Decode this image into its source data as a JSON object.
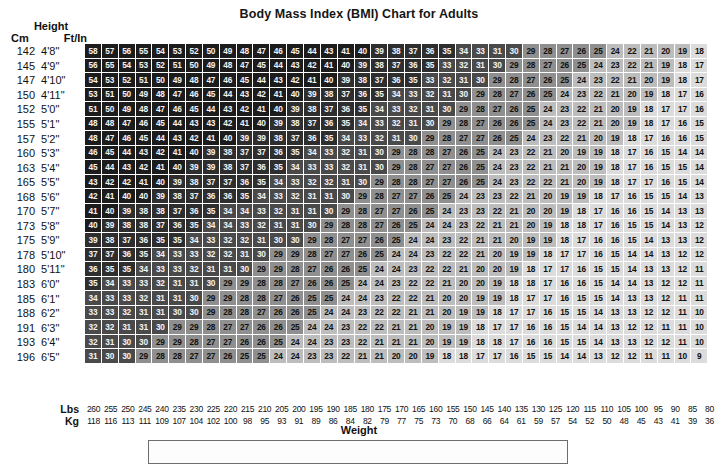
{
  "title": "Body Mass Index (BMI) Chart for Adults",
  "height_header": {
    "group": "Height",
    "cm": "Cm",
    "ftin": "Ft/In"
  },
  "weight_header": {
    "lbs": "Lbs",
    "kg": "Kg",
    "axis_title": "Weight"
  },
  "colors": {
    "band_obese_iii": "#1c1c1c",
    "band_obese_ii": "#2e2e2e",
    "band_obese_i": "#4a4a4a",
    "band_overweight": "#8f8f8f",
    "band_normal": "#bdbdbd",
    "band_under": "#dcdcdc",
    "grid_line": "#ffffff",
    "text_dark": "#111111",
    "text_light": "#f2f2f2",
    "page_background": "#ffffff"
  },
  "chart_data": {
    "type": "heatmap",
    "title": "Body Mass Index (BMI) Chart for Adults",
    "xlabel": "Weight",
    "ylabel": "Height",
    "grid": true,
    "legend": "none",
    "x_axis": {
      "label": "Weight",
      "units": [
        "Lbs",
        "Kg"
      ],
      "lbs": [
        260,
        255,
        250,
        245,
        240,
        235,
        230,
        225,
        220,
        215,
        210,
        205,
        200,
        195,
        190,
        185,
        180,
        175,
        170,
        165,
        160,
        155,
        150,
        145,
        140,
        135,
        130,
        125,
        120,
        115,
        110,
        105,
        100,
        95,
        90,
        85,
        80
      ],
      "kg": [
        118,
        116,
        113,
        111,
        109,
        107,
        104,
        102,
        100,
        98,
        95,
        93,
        91,
        89,
        86,
        84,
        82,
        79,
        77,
        75,
        73,
        70,
        68,
        66,
        64,
        61,
        59,
        57,
        54,
        52,
        50,
        48,
        45,
        43,
        41,
        39,
        36
      ]
    },
    "y_axis": {
      "label": "Height",
      "units": [
        "Cm",
        "Ft/In"
      ],
      "cm": [
        142,
        145,
        147,
        150,
        152,
        155,
        157,
        160,
        163,
        165,
        168,
        170,
        173,
        175,
        178,
        180,
        183,
        185,
        188,
        191,
        193,
        196
      ],
      "ftin": [
        "4'8\"",
        "4'9\"",
        "4'10\"",
        "4'11\"",
        "5'0\"",
        "5'1\"",
        "5'2\"",
        "5'3\"",
        "5'4\"",
        "5'5\"",
        "5'6\"",
        "5'7\"",
        "5'8\"",
        "5'9\"",
        "5'10\"",
        "5'11\"",
        "6'0\"",
        "6'1\"",
        "6'2\"",
        "6'3\"",
        "6'4\"",
        "6'5\""
      ]
    },
    "bmi_bands": [
      {
        "name": "Underweight",
        "max": 18.5
      },
      {
        "name": "Normal",
        "min": 18.5,
        "max": 25
      },
      {
        "name": "Overweight",
        "min": 25,
        "max": 30
      },
      {
        "name": "Obese I",
        "min": 30,
        "max": 35
      },
      {
        "name": "Obese II",
        "min": 35,
        "max": 40
      },
      {
        "name": "Obese III",
        "min": 40
      }
    ],
    "values": [
      [
        58,
        57,
        56,
        55,
        54,
        53,
        52,
        50,
        49,
        48,
        47,
        46,
        45,
        44,
        43,
        41,
        40,
        39,
        38,
        37,
        36,
        35,
        34,
        33,
        31,
        30,
        29,
        28,
        27,
        26,
        25,
        24,
        22,
        21,
        20,
        19,
        18
      ],
      [
        56,
        55,
        54,
        53,
        52,
        51,
        50,
        49,
        48,
        47,
        45,
        44,
        43,
        42,
        41,
        40,
        39,
        38,
        37,
        36,
        35,
        33,
        32,
        31,
        30,
        29,
        28,
        27,
        26,
        25,
        24,
        23,
        22,
        21,
        19,
        18,
        17
      ],
      [
        54,
        53,
        52,
        51,
        50,
        49,
        48,
        47,
        46,
        45,
        44,
        43,
        42,
        41,
        40,
        39,
        38,
        37,
        36,
        35,
        33,
        32,
        31,
        30,
        29,
        28,
        27,
        26,
        25,
        24,
        23,
        22,
        21,
        20,
        19,
        18,
        17
      ],
      [
        53,
        51,
        50,
        49,
        48,
        47,
        46,
        45,
        44,
        43,
        42,
        41,
        40,
        39,
        38,
        37,
        36,
        35,
        34,
        33,
        32,
        31,
        30,
        29,
        28,
        27,
        26,
        25,
        24,
        23,
        22,
        21,
        20,
        19,
        18,
        17,
        16
      ],
      [
        51,
        50,
        49,
        48,
        47,
        46,
        45,
        44,
        43,
        42,
        41,
        40,
        39,
        38,
        37,
        36,
        35,
        34,
        33,
        32,
        31,
        30,
        29,
        28,
        27,
        26,
        25,
        24,
        23,
        22,
        21,
        20,
        19,
        18,
        17,
        17,
        16
      ],
      [
        48,
        48,
        47,
        46,
        45,
        44,
        43,
        43,
        42,
        41,
        40,
        39,
        38,
        37,
        36,
        35,
        34,
        33,
        32,
        31,
        30,
        29,
        28,
        27,
        26,
        26,
        25,
        24,
        23,
        22,
        21,
        20,
        19,
        18,
        17,
        16,
        15
      ],
      [
        48,
        47,
        46,
        45,
        44,
        43,
        42,
        41,
        40,
        39,
        39,
        38,
        37,
        36,
        35,
        34,
        33,
        32,
        31,
        30,
        29,
        28,
        27,
        27,
        26,
        25,
        24,
        23,
        22,
        21,
        20,
        19,
        18,
        17,
        16,
        16,
        15
      ],
      [
        46,
        45,
        44,
        43,
        42,
        41,
        40,
        39,
        38,
        37,
        37,
        36,
        35,
        34,
        33,
        32,
        31,
        30,
        29,
        28,
        28,
        27,
        26,
        25,
        24,
        23,
        22,
        21,
        20,
        19,
        19,
        18,
        17,
        16,
        15,
        14,
        14
      ],
      [
        45,
        44,
        43,
        42,
        41,
        40,
        39,
        39,
        38,
        37,
        36,
        35,
        34,
        33,
        33,
        32,
        31,
        30,
        29,
        28,
        27,
        27,
        26,
        25,
        24,
        23,
        22,
        21,
        21,
        20,
        19,
        18,
        17,
        16,
        15,
        15,
        14
      ],
      [
        43,
        42,
        42,
        41,
        40,
        39,
        38,
        37,
        37,
        36,
        35,
        34,
        33,
        32,
        32,
        31,
        30,
        29,
        28,
        28,
        27,
        27,
        26,
        25,
        24,
        23,
        22,
        22,
        21,
        20,
        19,
        18,
        17,
        17,
        16,
        15,
        14
      ],
      [
        42,
        41,
        40,
        40,
        39,
        38,
        37,
        36,
        36,
        35,
        34,
        33,
        32,
        31,
        31,
        30,
        29,
        28,
        27,
        27,
        26,
        25,
        24,
        23,
        23,
        22,
        21,
        20,
        19,
        19,
        18,
        17,
        16,
        15,
        15,
        14,
        13
      ],
      [
        41,
        40,
        39,
        38,
        38,
        37,
        36,
        35,
        34,
        34,
        33,
        32,
        31,
        31,
        30,
        29,
        28,
        27,
        27,
        26,
        25,
        24,
        23,
        23,
        22,
        21,
        20,
        20,
        19,
        18,
        17,
        16,
        16,
        15,
        14,
        13,
        13
      ],
      [
        40,
        39,
        38,
        38,
        37,
        36,
        35,
        34,
        34,
        33,
        32,
        31,
        31,
        30,
        29,
        28,
        28,
        27,
        26,
        25,
        24,
        24,
        23,
        22,
        21,
        21,
        20,
        19,
        18,
        18,
        17,
        16,
        15,
        15,
        14,
        13,
        12
      ],
      [
        39,
        38,
        37,
        36,
        35,
        35,
        34,
        33,
        32,
        32,
        31,
        30,
        30,
        29,
        28,
        27,
        27,
        26,
        25,
        24,
        24,
        23,
        22,
        21,
        21,
        20,
        19,
        19,
        18,
        17,
        16,
        16,
        15,
        14,
        13,
        13,
        12
      ],
      [
        37,
        37,
        36,
        35,
        34,
        33,
        33,
        32,
        32,
        31,
        30,
        29,
        29,
        28,
        27,
        27,
        26,
        25,
        24,
        24,
        23,
        22,
        22,
        21,
        20,
        19,
        19,
        18,
        17,
        17,
        16,
        15,
        14,
        14,
        13,
        12,
        12
      ],
      [
        36,
        35,
        35,
        34,
        33,
        33,
        32,
        31,
        31,
        30,
        29,
        29,
        28,
        27,
        26,
        26,
        25,
        24,
        24,
        23,
        22,
        22,
        21,
        20,
        20,
        19,
        18,
        17,
        17,
        16,
        15,
        15,
        14,
        13,
        13,
        12,
        11
      ],
      [
        35,
        34,
        33,
        33,
        32,
        31,
        31,
        30,
        29,
        29,
        28,
        28,
        27,
        26,
        26,
        25,
        24,
        24,
        23,
        22,
        22,
        21,
        20,
        20,
        19,
        18,
        18,
        17,
        16,
        16,
        15,
        14,
        14,
        13,
        12,
        12,
        11
      ],
      [
        34,
        33,
        33,
        32,
        31,
        31,
        30,
        29,
        29,
        28,
        28,
        27,
        26,
        25,
        25,
        24,
        24,
        23,
        22,
        22,
        21,
        20,
        20,
        19,
        19,
        18,
        17,
        17,
        16,
        15,
        15,
        14,
        13,
        13,
        12,
        11,
        11
      ],
      [
        33,
        33,
        32,
        31,
        31,
        30,
        30,
        29,
        28,
        28,
        27,
        26,
        26,
        25,
        24,
        24,
        23,
        22,
        22,
        21,
        21,
        20,
        19,
        19,
        18,
        17,
        17,
        16,
        15,
        15,
        14,
        13,
        13,
        12,
        12,
        11,
        10
      ],
      [
        32,
        32,
        31,
        31,
        30,
        29,
        29,
        28,
        27,
        27,
        26,
        26,
        25,
        24,
        24,
        23,
        22,
        22,
        21,
        21,
        20,
        19,
        19,
        18,
        17,
        17,
        16,
        16,
        15,
        14,
        14,
        13,
        12,
        12,
        11,
        11,
        10
      ],
      [
        32,
        31,
        30,
        30,
        29,
        29,
        28,
        27,
        27,
        26,
        26,
        25,
        24,
        24,
        23,
        23,
        22,
        21,
        21,
        21,
        20,
        19,
        19,
        18,
        18,
        17,
        16,
        16,
        15,
        15,
        14,
        13,
        13,
        12,
        12,
        11,
        10,
        10
      ],
      [
        31,
        30,
        30,
        29,
        28,
        28,
        27,
        27,
        26,
        25,
        25,
        24,
        24,
        23,
        23,
        22,
        21,
        21,
        20,
        20,
        19,
        18,
        18,
        17,
        17,
        16,
        15,
        15,
        14,
        14,
        13,
        12,
        12,
        11,
        11,
        10,
        9
      ]
    ]
  }
}
